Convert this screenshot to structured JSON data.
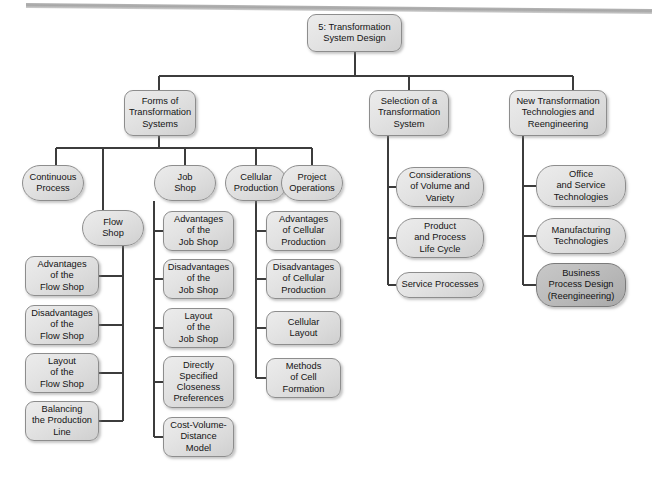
{
  "diagram": {
    "title_text": "5: Transformation System Design",
    "type": "tree",
    "top_rule": "horizontal-gray-rule",
    "colors": {
      "node_fill_light": "#e3e3e3",
      "node_fill_highlight": "#bdbdbd",
      "node_border": "#8d8d8d",
      "connector": "#3c3c3c",
      "text": "#141414",
      "top_rule": "#a7a7a7",
      "page_background": "#ffffff"
    },
    "nodes": [
      {
        "id": "root",
        "label": "5: Transformation\nSystem Design",
        "x": 307,
        "y": 14,
        "w": 95,
        "h": 38,
        "shape": "rounded",
        "highlight": false,
        "level": 1
      },
      {
        "id": "forms",
        "label": "Forms of\nTransformation\nSystems",
        "x": 124,
        "y": 90,
        "w": 72,
        "h": 46,
        "shape": "rounded",
        "highlight": false,
        "level": 2
      },
      {
        "id": "selection",
        "label": "Selection of a\nTransformation\nSystem",
        "x": 369,
        "y": 90,
        "w": 80,
        "h": 46,
        "shape": "rounded",
        "highlight": false,
        "level": 2
      },
      {
        "id": "newtech",
        "label": "New Transformation\nTechnologies and\nReengineering",
        "x": 509,
        "y": 90,
        "w": 98,
        "h": 46,
        "shape": "rounded",
        "highlight": false,
        "level": 2
      },
      {
        "id": "continuous",
        "label": "Continuous\nProcess",
        "x": 22,
        "y": 165,
        "w": 62,
        "h": 36,
        "shape": "pill",
        "highlight": false,
        "level": 3
      },
      {
        "id": "jobshop",
        "label": "Job\nShop",
        "x": 154,
        "y": 165,
        "w": 62,
        "h": 36,
        "shape": "pill",
        "highlight": false,
        "level": 3
      },
      {
        "id": "cellular",
        "label": "Cellular\nProduction",
        "x": 225,
        "y": 165,
        "w": 62,
        "h": 36,
        "shape": "pill",
        "highlight": false,
        "level": 3
      },
      {
        "id": "project",
        "label": "Project\nOperations",
        "x": 281,
        "y": 165,
        "w": 62,
        "h": 36,
        "shape": "pill",
        "highlight": false,
        "level": 3
      },
      {
        "id": "flowshop",
        "label": "Flow\nShop",
        "x": 82,
        "y": 210,
        "w": 62,
        "h": 36,
        "shape": "pill",
        "highlight": false,
        "level": 4
      },
      {
        "id": "fs_adv",
        "label": "Advantages\nof the\nFlow Shop",
        "x": 25,
        "y": 256,
        "w": 74,
        "h": 40,
        "shape": "rounded",
        "highlight": false,
        "level": 5
      },
      {
        "id": "fs_dis",
        "label": "Disadvantages\nof the\nFlow Shop",
        "x": 25,
        "y": 305,
        "w": 74,
        "h": 40,
        "shape": "rounded",
        "highlight": false,
        "level": 5
      },
      {
        "id": "fs_lay",
        "label": "Layout\nof the\nFlow Shop",
        "x": 25,
        "y": 353,
        "w": 74,
        "h": 40,
        "shape": "rounded",
        "highlight": false,
        "level": 5
      },
      {
        "id": "fs_bal",
        "label": "Balancing\nthe Production\nLine",
        "x": 25,
        "y": 401,
        "w": 74,
        "h": 40,
        "shape": "rounded",
        "highlight": false,
        "level": 5
      },
      {
        "id": "js_adv",
        "label": "Advantages\nof the\nJob Shop",
        "x": 163,
        "y": 211,
        "w": 71,
        "h": 40,
        "shape": "rounded",
        "highlight": false,
        "level": 5
      },
      {
        "id": "js_dis",
        "label": "Disadvantages\nof the\nJob Shop",
        "x": 163,
        "y": 259,
        "w": 71,
        "h": 40,
        "shape": "rounded",
        "highlight": false,
        "level": 5
      },
      {
        "id": "js_lay",
        "label": "Layout\nof the\nJob Shop",
        "x": 163,
        "y": 308,
        "w": 71,
        "h": 40,
        "shape": "rounded",
        "highlight": false,
        "level": 5
      },
      {
        "id": "js_close",
        "label": "Directly\nSpecified\nCloseness\nPreferences",
        "x": 163,
        "y": 356,
        "w": 71,
        "h": 52,
        "shape": "rounded",
        "highlight": false,
        "level": 5
      },
      {
        "id": "js_cvd",
        "label": "Cost-Volume-\nDistance\nModel",
        "x": 163,
        "y": 417,
        "w": 71,
        "h": 40,
        "shape": "rounded",
        "highlight": false,
        "level": 5
      },
      {
        "id": "cp_adv",
        "label": "Advantages\nof Cellular\nProduction",
        "x": 266,
        "y": 211,
        "w": 75,
        "h": 40,
        "shape": "rounded",
        "highlight": false,
        "level": 5
      },
      {
        "id": "cp_dis",
        "label": "Disadvantages\nof Cellular\nProduction",
        "x": 266,
        "y": 259,
        "w": 75,
        "h": 40,
        "shape": "rounded",
        "highlight": false,
        "level": 5
      },
      {
        "id": "cp_lay",
        "label": "Cellular\nLayout",
        "x": 266,
        "y": 311,
        "w": 75,
        "h": 34,
        "shape": "rounded",
        "highlight": false,
        "level": 5
      },
      {
        "id": "cp_meth",
        "label": "Methods\nof Cell\nFormation",
        "x": 266,
        "y": 358,
        "w": 75,
        "h": 40,
        "shape": "rounded",
        "highlight": false,
        "level": 5
      },
      {
        "id": "sel_vol",
        "label": "Considerations\nof Volume and\nVariety",
        "x": 396,
        "y": 167,
        "w": 88,
        "h": 40,
        "shape": "pill",
        "highlight": false,
        "level": 3
      },
      {
        "id": "sel_life",
        "label": "Product\nand Process\nLife Cycle",
        "x": 396,
        "y": 218,
        "w": 88,
        "h": 40,
        "shape": "pill",
        "highlight": false,
        "level": 3
      },
      {
        "id": "sel_serv",
        "label": "Service Processes",
        "x": 396,
        "y": 272,
        "w": 88,
        "h": 26,
        "shape": "pill",
        "highlight": false,
        "level": 3
      },
      {
        "id": "nt_office",
        "label": "Office\nand Service\nTechnologies",
        "x": 536,
        "y": 165,
        "w": 90,
        "h": 42,
        "shape": "pill",
        "highlight": false,
        "level": 3
      },
      {
        "id": "nt_manuf",
        "label": "Manufacturing\nTechnologies",
        "x": 536,
        "y": 218,
        "w": 90,
        "h": 36,
        "shape": "pill",
        "highlight": false,
        "level": 3
      },
      {
        "id": "nt_bpr",
        "label": "Business\nProcess Design\n(Reengineering)",
        "x": 536,
        "y": 263,
        "w": 90,
        "h": 44,
        "shape": "pill",
        "highlight": true,
        "level": 3
      }
    ],
    "edges": [
      {
        "from": "root",
        "to": "forms",
        "style": "orthogonal-down"
      },
      {
        "from": "root",
        "to": "selection",
        "style": "orthogonal-down"
      },
      {
        "from": "root",
        "to": "newtech",
        "style": "orthogonal-down"
      },
      {
        "from": "forms",
        "to": "continuous",
        "style": "orthogonal-down"
      },
      {
        "from": "forms",
        "to": "jobshop",
        "style": "orthogonal-down"
      },
      {
        "from": "forms",
        "to": "cellular",
        "style": "orthogonal-down"
      },
      {
        "from": "forms",
        "to": "project",
        "style": "orthogonal-down"
      },
      {
        "from": "forms",
        "to": "flowshop",
        "style": "orthogonal-down"
      },
      {
        "from": "flowshop",
        "to": "fs_adv",
        "style": "spine-left"
      },
      {
        "from": "flowshop",
        "to": "fs_dis",
        "style": "spine-left"
      },
      {
        "from": "flowshop",
        "to": "fs_lay",
        "style": "spine-left"
      },
      {
        "from": "flowshop",
        "to": "fs_bal",
        "style": "spine-left"
      },
      {
        "from": "jobshop",
        "to": "js_adv",
        "style": "spine-right"
      },
      {
        "from": "jobshop",
        "to": "js_dis",
        "style": "spine-right"
      },
      {
        "from": "jobshop",
        "to": "js_lay",
        "style": "spine-right"
      },
      {
        "from": "jobshop",
        "to": "js_close",
        "style": "spine-right"
      },
      {
        "from": "jobshop",
        "to": "js_cvd",
        "style": "spine-right"
      },
      {
        "from": "cellular",
        "to": "cp_adv",
        "style": "spine-right"
      },
      {
        "from": "cellular",
        "to": "cp_dis",
        "style": "spine-right"
      },
      {
        "from": "cellular",
        "to": "cp_lay",
        "style": "spine-right"
      },
      {
        "from": "cellular",
        "to": "cp_meth",
        "style": "spine-right"
      },
      {
        "from": "selection",
        "to": "sel_vol",
        "style": "spine-right"
      },
      {
        "from": "selection",
        "to": "sel_life",
        "style": "spine-right"
      },
      {
        "from": "selection",
        "to": "sel_serv",
        "style": "spine-right"
      },
      {
        "from": "newtech",
        "to": "nt_office",
        "style": "spine-right"
      },
      {
        "from": "newtech",
        "to": "nt_manuf",
        "style": "spine-right"
      },
      {
        "from": "newtech",
        "to": "nt_bpr",
        "style": "spine-right"
      }
    ]
  }
}
